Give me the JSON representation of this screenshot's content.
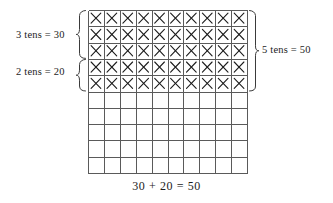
{
  "diagram": {
    "type": "place-value-grid",
    "grid": {
      "columns": 10,
      "rows": 10,
      "marked_rows": 5,
      "mark_symbol": "x-mark",
      "x_left": 88,
      "y_top": 10,
      "cell_width": 15.9,
      "cell_height": 16.3,
      "line_color": "#5a5a5a",
      "mark_color": "#1c1c1c"
    },
    "braces": [
      {
        "name": "brace-three-tens",
        "side": "left",
        "rows_from": 1,
        "rows_to": 3,
        "label": "3 tens = 30"
      },
      {
        "name": "brace-two-tens",
        "side": "left",
        "rows_from": 4,
        "rows_to": 5,
        "label": "2 tens = 20"
      },
      {
        "name": "brace-five-tens",
        "side": "right",
        "rows_from": 1,
        "rows_to": 5,
        "label": "5 tens = 50"
      }
    ],
    "labels": {
      "three_tens": "3 tens = 30",
      "two_tens": "2 tens = 20",
      "five_tens": "5 tens = 50"
    },
    "equation": "30 + 20 = 50"
  }
}
